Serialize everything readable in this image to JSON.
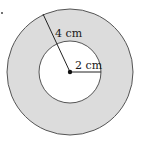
{
  "diagram": {
    "type": "annulus",
    "outer_radius_label": "4 cm",
    "inner_radius_label": "2 cm",
    "colors": {
      "shaded": "#dcdcdc",
      "stroke": "#555555",
      "inner_fill": "#ffffff"
    }
  }
}
